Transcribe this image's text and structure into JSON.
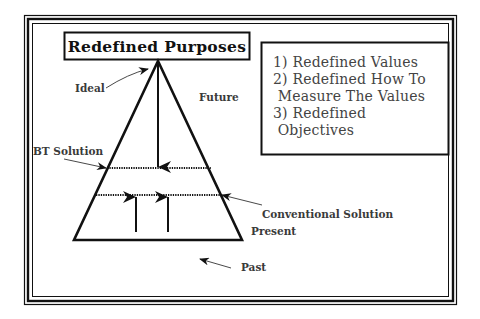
{
  "diagram": {
    "title": "Redefined Purposes",
    "objectives_box": {
      "lines": [
        "1) Redefined Values",
        "2) Redefined How To",
        " Measure The Values",
        "3) Redefined",
        " Objectives"
      ]
    },
    "labels": {
      "ideal": "Ideal",
      "future": "Future",
      "bt_solution": "BT Solution",
      "conventional_solution": "Conventional Solution",
      "present": "Present",
      "past": "Past"
    },
    "colors": {
      "line": "#111111",
      "label_text": "#3a3a3a",
      "list_text": "#444444",
      "background": "#ffffff"
    }
  }
}
